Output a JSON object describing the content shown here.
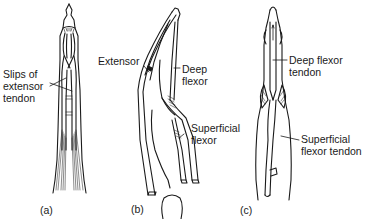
{
  "figure": {
    "panels": [
      {
        "id": "a",
        "caption": "(a)",
        "view": "dorsal",
        "labels": [
          {
            "line1": "Slips of",
            "line2": "extensor",
            "line3": "tendon"
          }
        ]
      },
      {
        "id": "b",
        "caption": "(b)",
        "view": "lateral",
        "labels": [
          {
            "line1": "Extensor"
          },
          {
            "line1": "Deep",
            "line2": "flexor"
          },
          {
            "line1": "Superficial",
            "line2": "flexor"
          }
        ]
      },
      {
        "id": "c",
        "caption": "(c)",
        "view": "palmar",
        "labels": [
          {
            "line1": "Deep flexor",
            "line2": "tendon"
          },
          {
            "line1": "Superficial",
            "line2": "flexor tendon"
          }
        ]
      }
    ],
    "colors": {
      "ink": "#1a1a1a",
      "background": "#ffffff"
    }
  }
}
